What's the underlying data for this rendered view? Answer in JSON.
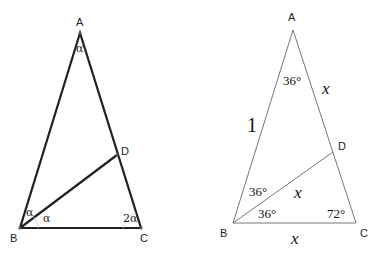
{
  "left_figure": {
    "vertices": {
      "A": {
        "label": "A",
        "x": 80,
        "y": 33
      },
      "B": {
        "label": "B",
        "x": 20,
        "y": 228
      },
      "C": {
        "label": "C",
        "x": 141,
        "y": 228
      },
      "D": {
        "label": "D",
        "x": 117,
        "y": 155
      }
    },
    "angle_labels": {
      "at_A": "α",
      "at_B_upper": "α",
      "at_B_lower": "α",
      "at_C": "2α"
    },
    "stroke_color": "#222222"
  },
  "right_figure": {
    "vertices": {
      "A": {
        "label": "A",
        "x": 293,
        "y": 30
      },
      "B": {
        "label": "B",
        "x": 233,
        "y": 223
      },
      "C": {
        "label": "C",
        "x": 356,
        "y": 223
      },
      "D": {
        "label": "D",
        "x": 333,
        "y": 152
      }
    },
    "angle_labels": {
      "at_A": "36°",
      "at_B_upper": "36°",
      "at_B_lower": "36°",
      "at_C": "72°"
    },
    "side_labels": {
      "AB": "1",
      "AD": "x",
      "BD": "x",
      "BC": "x"
    },
    "stroke_color": "#555555"
  }
}
